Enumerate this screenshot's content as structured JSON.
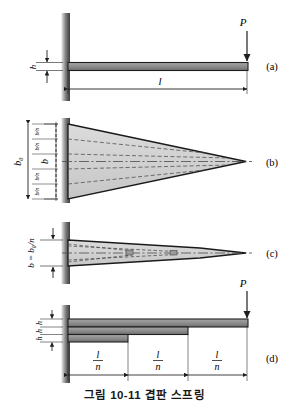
{
  "figure": {
    "caption": "그림 10-11  겹판 스프링",
    "number": "10-11",
    "title": "겹판 스프링"
  },
  "panels": [
    {
      "id": "a",
      "label": "(a)",
      "description": "cantilever-beam-uniform",
      "load_label": "P",
      "thickness_label": "h",
      "length_label": "l"
    },
    {
      "id": "b",
      "label": "(b)",
      "description": "triangular-plate-plan-view",
      "width_outer_label": "b₀",
      "width_inner_label": "b",
      "strip_labels": [
        "b/n",
        "b/n",
        "b/n",
        "b/n"
      ],
      "strip_count": 5,
      "divider_count": 4
    },
    {
      "id": "c",
      "label": "(c)",
      "description": "stacked-triangular-leaves",
      "width_label": "b = b₀/n"
    },
    {
      "id": "d",
      "label": "(d)",
      "description": "stepped-leaf-spring-elevation",
      "load_label": "P",
      "thickness_labels": [
        "h",
        "h",
        "h"
      ],
      "segment_labels": [
        "l/n",
        "l/n",
        "l/n"
      ],
      "leaf_count": 3
    }
  ],
  "colors": {
    "beam_fill": "#8f8f8f",
    "beam_edge": "#1f1f1f",
    "wall_fill": "#6e6e6e",
    "plate_fill": "#d2d2d2",
    "plate_edge": "#1a1a1a",
    "dashed": "#4a4a4a",
    "dimension": "#1f1f1f",
    "text": "#161616"
  }
}
